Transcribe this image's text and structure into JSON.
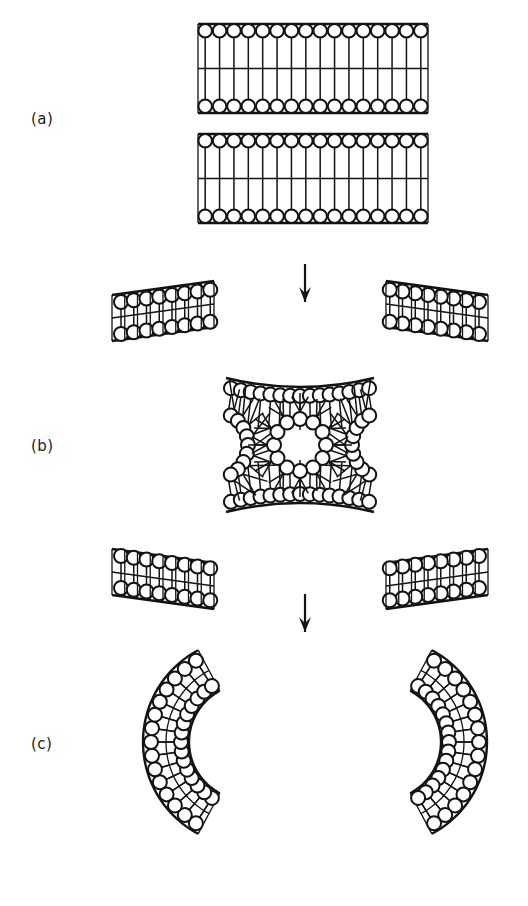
{
  "figure": {
    "background_color": "#ffffff",
    "ink_color": "#131313",
    "width": 528,
    "height": 906
  },
  "panels": [
    {
      "id": "a",
      "label": "(a)",
      "label_x": 31,
      "label_y": 110,
      "description": "Two apposed planar lipid bilayers",
      "bilayers": [
        {
          "x0": 198,
          "x1": 428,
          "y_top": 24,
          "y_bot": 113,
          "n_lipids": 16
        },
        {
          "x0": 198,
          "x1": 428,
          "y_top": 134,
          "y_bot": 223,
          "n_lipids": 16
        }
      ]
    },
    {
      "id": "b",
      "label": "(b)",
      "label_x": 31,
      "label_y": 437,
      "description": "Fusion intermediate: wings splay and a central inverted micelle forms between the bilayers",
      "micelle": {
        "cx": 300,
        "cy": 445,
        "ring_radius": 26,
        "head_radius": 7,
        "n_lipids": 12,
        "tail_length": 26
      },
      "wings": [
        {
          "corner": "top-left",
          "n_lipids": 8
        },
        {
          "corner": "top-right",
          "n_lipids": 8
        },
        {
          "corner": "bottom-left",
          "n_lipids": 8
        },
        {
          "corner": "bottom-right",
          "n_lipids": 8
        }
      ],
      "necks": [
        {
          "side": "left",
          "cx": 214,
          "cy": 445,
          "n_lipids": 9
        },
        {
          "side": "right",
          "cx": 386,
          "cy": 445,
          "n_lipids": 9
        }
      ],
      "facing_monolayers": [
        {
          "edge": "top",
          "n_lipids": 15
        },
        {
          "edge": "bottom",
          "n_lipids": 15
        }
      ]
    },
    {
      "id": "c",
      "label": "(c)",
      "label_x": 31,
      "label_y": 735,
      "description": "Resolution into two separated, highly curved bilayer arcs",
      "arcs": [
        {
          "side": "left",
          "cx": 247,
          "cy": 742,
          "r_inner": 58,
          "r_outer": 104,
          "a_start": 118,
          "a_end": 242,
          "n_lipids": 15,
          "opens": "left"
        },
        {
          "side": "right",
          "cx": 383,
          "cy": 742,
          "r_inner": 58,
          "r_outer": 104,
          "a_start": -62,
          "a_end": 62,
          "n_lipids": 15,
          "opens": "right"
        }
      ]
    }
  ],
  "arrows": [
    {
      "name": "arrow-a-to-b",
      "x": 305,
      "y_start": 264,
      "y_end": 302
    },
    {
      "name": "arrow-b-to-c",
      "x": 305,
      "y_start": 594,
      "y_end": 632
    }
  ]
}
